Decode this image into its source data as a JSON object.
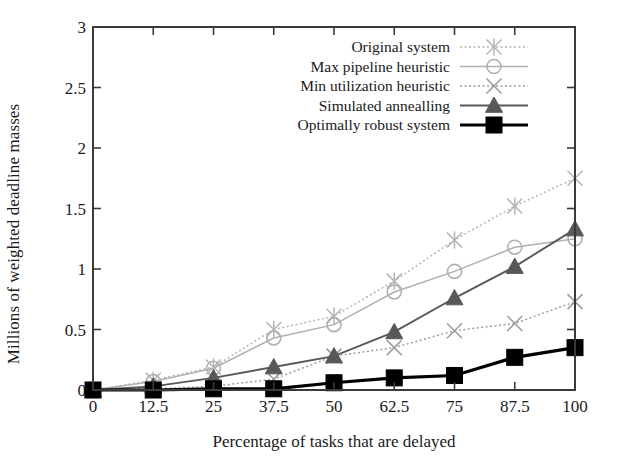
{
  "chart_data": {
    "type": "line",
    "title": "",
    "xlabel": "Percentage of tasks that are delayed",
    "ylabel": "Millions of weighted deadline masses",
    "x": [
      0,
      12.5,
      25,
      37.5,
      50,
      62.5,
      75,
      87.5,
      100
    ],
    "xtick_labels": [
      "0",
      "12.5",
      "25",
      "37.5",
      "50",
      "62.5",
      "75",
      "87.5",
      "100"
    ],
    "ytick_labels": [
      "0",
      "0.5",
      "1",
      "1.5",
      "2",
      "2.5",
      "3"
    ],
    "yticks": [
      0,
      0.5,
      1,
      1.5,
      2,
      2.5,
      3
    ],
    "xlim": [
      0,
      100
    ],
    "ylim": [
      0,
      3
    ],
    "grid": false,
    "legend_position": "top-right",
    "series": [
      {
        "name": "Original system",
        "marker": "star",
        "linestyle": "dotted",
        "color": "#b4b4b4",
        "values": [
          0.0,
          0.08,
          0.19,
          0.5,
          0.61,
          0.9,
          1.24,
          1.52,
          1.75
        ]
      },
      {
        "name": "Max pipeline heuristic",
        "marker": "open-circle",
        "linestyle": "solid",
        "color": "#b0b0b0",
        "values": [
          0.0,
          0.07,
          0.18,
          0.43,
          0.54,
          0.81,
          0.98,
          1.18,
          1.25
        ]
      },
      {
        "name": "Min utilization heuristic",
        "marker": "cross",
        "linestyle": "dotted",
        "color": "#9e9e9e",
        "values": [
          0.0,
          0.01,
          0.03,
          0.09,
          0.28,
          0.35,
          0.49,
          0.55,
          0.73
        ]
      },
      {
        "name": "Simulated annealling",
        "marker": "triangle",
        "linestyle": "solid",
        "color": "#585858",
        "values": [
          0.0,
          0.03,
          0.1,
          0.19,
          0.28,
          0.48,
          0.76,
          1.02,
          1.33
        ]
      },
      {
        "name": "Optimally robust system",
        "marker": "square",
        "linestyle": "solid",
        "color": "#000000",
        "values": [
          0.0,
          0.0,
          0.01,
          0.01,
          0.06,
          0.1,
          0.12,
          0.27,
          0.35
        ]
      }
    ]
  },
  "legend": {
    "entries": [
      "Original system",
      "Max pipeline heuristic",
      "Min utilization heuristic",
      "Simulated annealling",
      "Optimally robust system"
    ]
  },
  "axes": {
    "frame_color": "#3a3a3a",
    "background": "#ffffff"
  }
}
